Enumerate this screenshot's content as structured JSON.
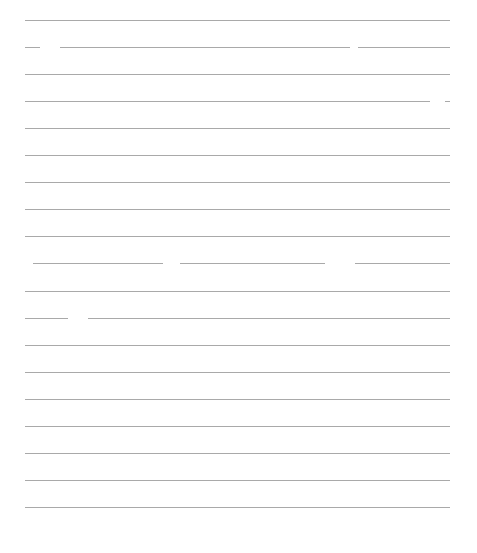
{
  "page": {
    "type": "blank lined paper",
    "line_color": "#9a9a9a",
    "background": "#ffffff",
    "left": 25,
    "right": 450,
    "first_y": 20,
    "spacing": 27.05,
    "lines": [
      {
        "segments": [
          [
            25,
            450
          ]
        ]
      },
      {
        "segments": [
          [
            25,
            40
          ],
          [
            60,
            350
          ],
          [
            358,
            450
          ]
        ]
      },
      {
        "segments": [
          [
            25,
            450
          ]
        ]
      },
      {
        "segments": [
          [
            25,
            430
          ],
          [
            445,
            450
          ]
        ]
      },
      {
        "segments": [
          [
            25,
            450
          ]
        ]
      },
      {
        "segments": [
          [
            25,
            450
          ]
        ]
      },
      {
        "segments": [
          [
            25,
            450
          ]
        ]
      },
      {
        "segments": [
          [
            25,
            450
          ]
        ]
      },
      {
        "segments": [
          [
            25,
            450
          ]
        ]
      },
      {
        "segments": [
          [
            33,
            163
          ],
          [
            180,
            325
          ],
          [
            355,
            450
          ]
        ]
      },
      {
        "segments": [
          [
            25,
            450
          ]
        ]
      },
      {
        "segments": [
          [
            25,
            68
          ],
          [
            88,
            450
          ]
        ]
      },
      {
        "segments": [
          [
            25,
            450
          ]
        ]
      },
      {
        "segments": [
          [
            25,
            450
          ]
        ]
      },
      {
        "segments": [
          [
            25,
            450
          ]
        ]
      },
      {
        "segments": [
          [
            25,
            450
          ]
        ]
      },
      {
        "segments": [
          [
            25,
            450
          ]
        ]
      },
      {
        "segments": [
          [
            25,
            450
          ]
        ]
      },
      {
        "segments": [
          [
            25,
            450
          ]
        ]
      }
    ]
  }
}
